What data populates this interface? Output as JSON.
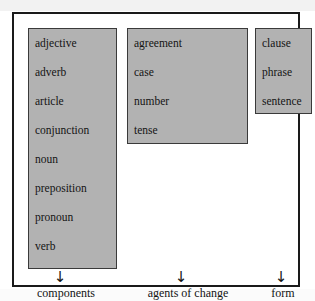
{
  "diagram": {
    "type": "classification-tree",
    "columns": [
      {
        "id": "components",
        "label": "components",
        "arrow_glyph": "↓",
        "items": [
          "adjective",
          "adverb",
          "article",
          "conjunction",
          "noun",
          "preposition",
          "pronoun",
          "verb"
        ]
      },
      {
        "id": "agents-of-change",
        "label": "agents of change",
        "arrow_glyph": "↓",
        "items": [
          "agreement",
          "case",
          "number",
          "tense"
        ]
      },
      {
        "id": "form",
        "label": "form",
        "arrow_glyph": "↓",
        "items": [
          "clause",
          "phrase",
          "sentence"
        ]
      }
    ]
  },
  "colors": {
    "box_fill": "#b2b2b2",
    "box_border": "#3a3a3a",
    "frame_border": "#1a1a1a",
    "text": "#141414",
    "page_background": "#ffffff"
  }
}
